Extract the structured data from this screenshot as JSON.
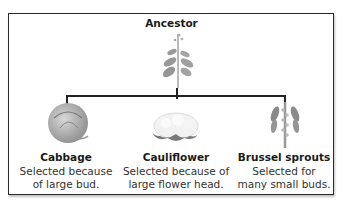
{
  "diagram": {
    "title": "Ancestor",
    "type": "tree",
    "root": {
      "label": "Ancestor",
      "icon": "wild-mustard-plant-icon"
    },
    "children": [
      {
        "name": "Cabbage",
        "description_line1": "Selected because",
        "description_line2": "of large bud.",
        "icon": "cabbage-icon"
      },
      {
        "name": "Cauliflower",
        "description_line1": "Selected because of",
        "description_line2": "large flower head.",
        "icon": "cauliflower-icon"
      },
      {
        "name": "Brussel sprouts",
        "description_line1": "Selected for",
        "description_line2": "many small buds.",
        "icon": "brussel-sprouts-icon"
      }
    ],
    "colors": {
      "border": "#2b2b2b",
      "lines": "#222222",
      "plant_gray": "#9a9a9a"
    }
  }
}
